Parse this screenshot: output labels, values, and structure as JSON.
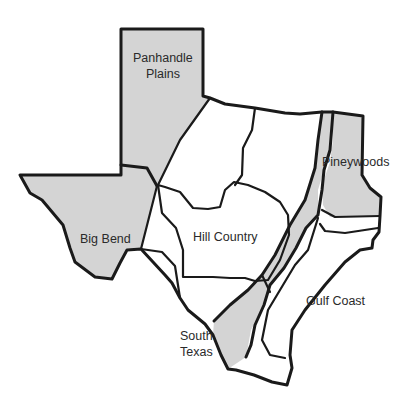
{
  "map": {
    "title": "Texas Regions",
    "colors": {
      "shaded": "#d4d4d4",
      "plain": "#ffffff",
      "border": "#1a1a1a",
      "text": "#2a2a2a"
    },
    "regions": [
      {
        "id": "panhandle-plains",
        "label_lines": [
          "Panhandle",
          "Plains"
        ],
        "shaded": true
      },
      {
        "id": "big-bend",
        "label_lines": [
          "Big Bend"
        ],
        "shaded": true
      },
      {
        "id": "hill-country",
        "label_lines": [
          "Hill Country"
        ],
        "shaded": false
      },
      {
        "id": "pineywoods",
        "label_lines": [
          "Pineywoods"
        ],
        "shaded": true
      },
      {
        "id": "gulf-coast",
        "label_lines": [
          "Gulf Coast"
        ],
        "shaded": false
      },
      {
        "id": "south-texas",
        "label_lines": [
          "South",
          "Texas"
        ],
        "shaded": false
      }
    ]
  }
}
